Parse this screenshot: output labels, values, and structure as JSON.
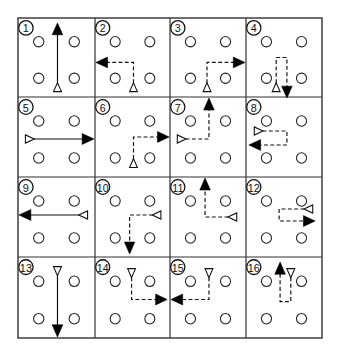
{
  "diagram": {
    "grid": {
      "rows": 4,
      "cols": 4,
      "x_lines": [
        18,
        95,
        170,
        246,
        322
      ],
      "y_lines": [
        18,
        97,
        177,
        257,
        338
      ]
    },
    "colors": {
      "line": "#111111",
      "border": "#333333",
      "filled_arrow": "#000000",
      "background": "#ffffff"
    },
    "players": [
      [
        21,
        24
      ],
      [
        57,
        24
      ],
      [
        21,
        61
      ],
      [
        57,
        61
      ]
    ],
    "legend": {
      "open_triangle": "start-marker",
      "filled_arrow": "end-arrowhead",
      "solid_line": "straight-path",
      "dashed_line": "turning-path"
    },
    "cells": [
      {
        "label": "1",
        "style": "solid",
        "points": [
          [
            40,
            70
          ],
          [
            40,
            16
          ]
        ],
        "start_dir": "up",
        "end_dir": "up"
      },
      {
        "label": "2",
        "style": "dashed",
        "points": [
          [
            40,
            70
          ],
          [
            40,
            45
          ],
          [
            12,
            45
          ]
        ],
        "start_dir": "up",
        "end_dir": "left"
      },
      {
        "label": "3",
        "style": "dashed",
        "points": [
          [
            38,
            70
          ],
          [
            38,
            45
          ],
          [
            66,
            45
          ]
        ],
        "start_dir": "up",
        "end_dir": "right"
      },
      {
        "label": "4",
        "style": "dashed",
        "points": [
          [
            31,
            70
          ],
          [
            31,
            40
          ],
          [
            42,
            40
          ],
          [
            42,
            70
          ]
        ],
        "start_dir": "up",
        "end_dir": "down"
      },
      {
        "label": "5",
        "style": "solid",
        "points": [
          [
            12,
            42
          ],
          [
            66,
            42
          ]
        ],
        "start_dir": "right",
        "end_dir": "right"
      },
      {
        "label": "6",
        "style": "dashed",
        "points": [
          [
            40,
            66
          ],
          [
            40,
            40
          ],
          [
            66,
            40
          ]
        ],
        "start_dir": "up",
        "end_dir": "right"
      },
      {
        "label": "7",
        "style": "dashed",
        "points": [
          [
            12,
            42
          ],
          [
            40,
            42
          ],
          [
            40,
            12
          ]
        ],
        "start_dir": "right",
        "end_dir": "up"
      },
      {
        "label": "8",
        "style": "dashed",
        "points": [
          [
            13,
            34
          ],
          [
            42,
            34
          ],
          [
            42,
            48
          ],
          [
            14,
            48
          ]
        ],
        "start_dir": "right",
        "end_dir": "left"
      },
      {
        "label": "9",
        "style": "solid",
        "points": [
          [
            66,
            38
          ],
          [
            12,
            38
          ]
        ],
        "start_dir": "left",
        "end_dir": "left"
      },
      {
        "label": "10",
        "style": "dashed",
        "points": [
          [
            64,
            38
          ],
          [
            36,
            38
          ],
          [
            36,
            66
          ]
        ],
        "start_dir": "left",
        "end_dir": "down"
      },
      {
        "label": "11",
        "style": "dashed",
        "points": [
          [
            64,
            40
          ],
          [
            36,
            40
          ],
          [
            36,
            12
          ]
        ],
        "start_dir": "left",
        "end_dir": "up"
      },
      {
        "label": "12",
        "style": "dashed",
        "points": [
          [
            64,
            32
          ],
          [
            34,
            32
          ],
          [
            34,
            44
          ],
          [
            60,
            44
          ]
        ],
        "start_dir": "left",
        "end_dir": "right"
      },
      {
        "label": "13",
        "style": "solid",
        "points": [
          [
            40,
            14
          ],
          [
            40,
            68
          ]
        ],
        "start_dir": "down",
        "end_dir": "down"
      },
      {
        "label": "14",
        "style": "dashed",
        "points": [
          [
            38,
            16
          ],
          [
            38,
            42
          ],
          [
            64,
            42
          ]
        ],
        "start_dir": "down",
        "end_dir": "right"
      },
      {
        "label": "15",
        "style": "dashed",
        "points": [
          [
            40,
            16
          ],
          [
            40,
            42
          ],
          [
            12,
            42
          ]
        ],
        "start_dir": "down",
        "end_dir": "left"
      },
      {
        "label": "16",
        "style": "dashed",
        "points": [
          [
            46,
            16
          ],
          [
            46,
            44
          ],
          [
            35,
            44
          ],
          [
            35,
            16
          ]
        ],
        "start_dir": "down",
        "end_dir": "up"
      }
    ]
  }
}
